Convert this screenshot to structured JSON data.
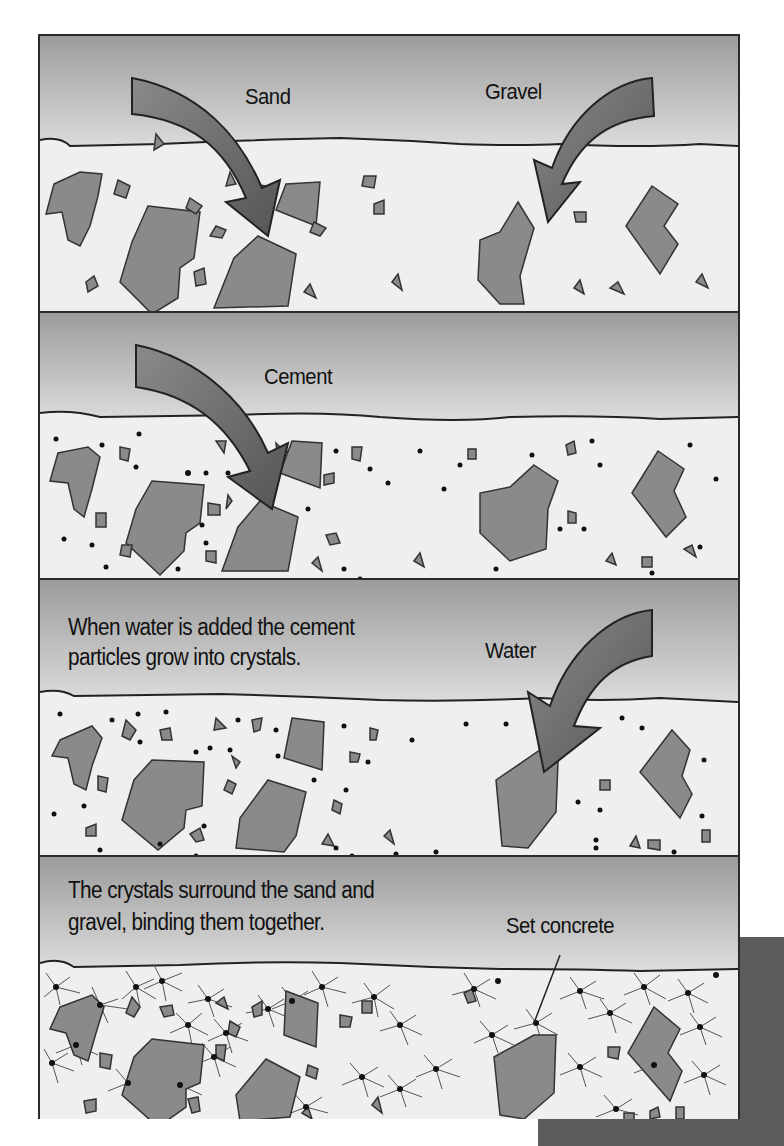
{
  "figure": {
    "colors": {
      "sky_top": "#9a9a9a",
      "sky_bottom": "#dcdcdc",
      "mix": "#efefef",
      "rock_fill": "#8a8a8a",
      "arrow_fill": "#6e6e6e",
      "outline": "#222222",
      "backbox": "#5c5c5c"
    }
  },
  "panels": [
    {
      "step": 1,
      "labels": {
        "sand": "Sand",
        "gravel": "Gravel"
      },
      "arrows": [
        "sand-arrow",
        "gravel-arrow"
      ]
    },
    {
      "step": 2,
      "labels": {
        "cement": "Cement"
      },
      "arrows": [
        "cement-arrow"
      ]
    },
    {
      "step": 3,
      "caption_line1": "When water is added the cement",
      "caption_line2": "particles grow into crystals.",
      "labels": {
        "water": "Water"
      },
      "arrows": [
        "water-arrow"
      ]
    },
    {
      "step": 4,
      "caption_line1": "The crystals surround the sand and",
      "caption_line2": "gravel, binding them together.",
      "labels": {
        "set_concrete": "Set concrete"
      }
    }
  ]
}
